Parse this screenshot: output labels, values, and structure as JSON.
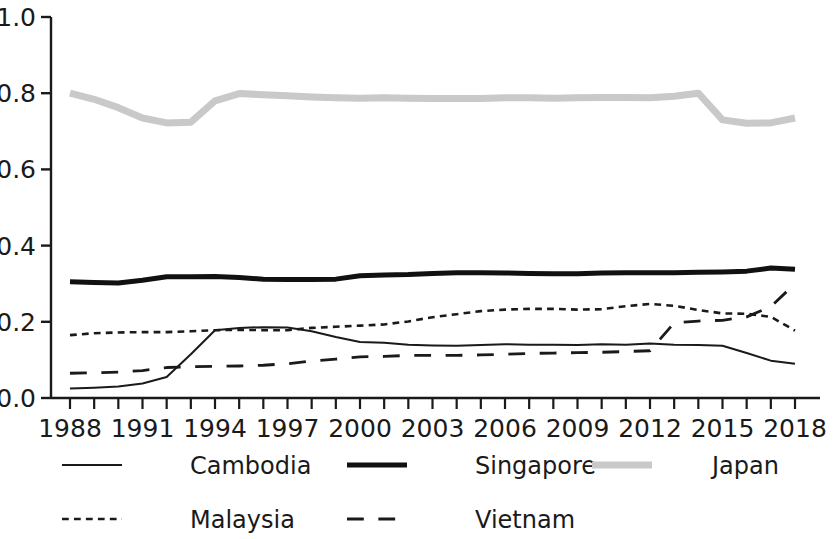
{
  "chart_data": {
    "type": "line",
    "title": "",
    "xlabel": "",
    "ylabel": "",
    "xlim": [
      1988,
      2018
    ],
    "ylim": [
      0.0,
      1.0
    ],
    "grid": false,
    "legend_position": "bottom",
    "x_tick_labels": [
      "1988",
      "1991",
      "1994",
      "1997",
      "2000",
      "2003",
      "2006",
      "2009",
      "2012",
      "2015",
      "2018"
    ],
    "x_tick_values": [
      1988,
      1991,
      1994,
      1997,
      2000,
      2003,
      2006,
      2009,
      2012,
      2015,
      2018
    ],
    "x_minor_ticks_every": 1,
    "y_tick_labels": [
      "0.0",
      "0.2",
      "0.4",
      "0.6",
      "0.8",
      "1.0"
    ],
    "y_tick_values": [
      0.0,
      0.2,
      0.4,
      0.6,
      0.8,
      1.0
    ],
    "x": [
      1988,
      1989,
      1990,
      1991,
      1992,
      1993,
      1994,
      1995,
      1996,
      1997,
      1998,
      1999,
      2000,
      2001,
      2002,
      2003,
      2004,
      2005,
      2006,
      2007,
      2008,
      2009,
      2010,
      2011,
      2012,
      2013,
      2014,
      2015,
      2016,
      2017,
      2018
    ],
    "series": [
      {
        "name": "Cambodia",
        "style": "solid-thin",
        "color": "#1a1a1a",
        "width": 2.0,
        "values": [
          0.025,
          0.027,
          0.03,
          0.038,
          0.055,
          0.115,
          0.178,
          0.184,
          0.186,
          0.185,
          0.175,
          0.16,
          0.147,
          0.145,
          0.14,
          0.138,
          0.137,
          0.139,
          0.141,
          0.14,
          0.14,
          0.139,
          0.141,
          0.14,
          0.143,
          0.14,
          0.139,
          0.137,
          0.118,
          0.098,
          0.09
        ]
      },
      {
        "name": "Singapore",
        "style": "solid-thick",
        "color": "#111111",
        "width": 5.0,
        "values": [
          0.305,
          0.303,
          0.302,
          0.309,
          0.318,
          0.318,
          0.319,
          0.316,
          0.312,
          0.311,
          0.311,
          0.312,
          0.321,
          0.323,
          0.324,
          0.327,
          0.329,
          0.329,
          0.328,
          0.327,
          0.326,
          0.326,
          0.328,
          0.329,
          0.329,
          0.329,
          0.33,
          0.331,
          0.333,
          0.341,
          0.338
        ]
      },
      {
        "name": "Japan",
        "style": "solid-thick",
        "color": "#c9c9c9",
        "width": 7.0,
        "values": [
          0.8,
          0.784,
          0.762,
          0.735,
          0.722,
          0.724,
          0.78,
          0.799,
          0.796,
          0.793,
          0.79,
          0.788,
          0.787,
          0.788,
          0.787,
          0.786,
          0.786,
          0.786,
          0.788,
          0.788,
          0.787,
          0.788,
          0.789,
          0.789,
          0.788,
          0.792,
          0.8,
          0.73,
          0.721,
          0.722,
          0.735
        ]
      },
      {
        "name": "Malaysia",
        "style": "dashed-fine",
        "color": "#1a1a1a",
        "width": 2.6,
        "values": [
          0.165,
          0.17,
          0.172,
          0.173,
          0.173,
          0.175,
          0.178,
          0.179,
          0.178,
          0.178,
          0.184,
          0.187,
          0.19,
          0.193,
          0.201,
          0.212,
          0.22,
          0.228,
          0.232,
          0.234,
          0.234,
          0.232,
          0.233,
          0.241,
          0.247,
          0.242,
          0.231,
          0.222,
          0.221,
          0.213,
          0.177
        ]
      },
      {
        "name": "Vietnam",
        "style": "dashed-long",
        "color": "#1a1a1a",
        "width": 2.8,
        "values": [
          0.065,
          0.066,
          0.068,
          0.072,
          0.08,
          0.082,
          0.083,
          0.084,
          0.086,
          0.09,
          0.097,
          0.102,
          0.108,
          0.109,
          0.112,
          0.112,
          0.112,
          0.113,
          0.115,
          0.117,
          0.118,
          0.119,
          0.12,
          0.122,
          0.124,
          0.197,
          0.202,
          0.204,
          0.213,
          0.24,
          0.3
        ]
      }
    ]
  },
  "legend": {
    "entries": [
      {
        "label": "Cambodia",
        "style": "solid-thin"
      },
      {
        "label": "Singapore",
        "style": "solid-thick"
      },
      {
        "label": "Japan",
        "style": "solid-gray"
      },
      {
        "label": "Malaysia",
        "style": "dashed-fine"
      },
      {
        "label": "Vietnam",
        "style": "dashed-long"
      }
    ]
  }
}
